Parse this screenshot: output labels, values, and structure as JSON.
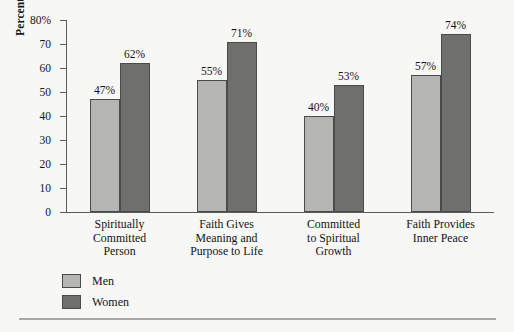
{
  "chart_data": {
    "type": "bar",
    "title": "",
    "xlabel": "",
    "ylabel": "Percent Agreeing",
    "ylim": [
      0,
      80
    ],
    "y_ticks": [
      0,
      10,
      20,
      30,
      40,
      50,
      60,
      70,
      80
    ],
    "y_tick_labels": [
      "0",
      "10",
      "20",
      "30",
      "40",
      "50",
      "60",
      "70",
      "80%"
    ],
    "grid": false,
    "legend_position": "bottom-left",
    "categories": [
      "Spiritually\nCommitted\nPerson",
      "Faith Gives\nMeaning and\nPurpose to Life",
      "Committed\nto Spiritual\nGrowth",
      "Faith Provides\nInner Peace"
    ],
    "category_lines": [
      [
        "Spiritually",
        "Committed",
        "Person"
      ],
      [
        "Faith Gives",
        "Meaning and",
        "Purpose to Life"
      ],
      [
        "Committed",
        "to Spiritual",
        "Growth"
      ],
      [
        "Faith Provides",
        "Inner Peace"
      ]
    ],
    "series": [
      {
        "name": "Men",
        "color": "#b5b5b3",
        "values": [
          47,
          55,
          40,
          57
        ],
        "value_labels": [
          "47%",
          "55%",
          "40%",
          "57%"
        ]
      },
      {
        "name": "Women",
        "color": "#6f6f6d",
        "values": [
          62,
          71,
          53,
          74
        ],
        "value_labels": [
          "62%",
          "71%",
          "53%",
          "74%"
        ]
      }
    ]
  },
  "legend": {
    "items": [
      {
        "label": "Men",
        "color": "#b5b5b3"
      },
      {
        "label": "Women",
        "color": "#6f6f6d"
      }
    ]
  },
  "colors": {
    "background": "#f7f7f5",
    "axis": "#5a5a5a",
    "bar_border": "#4a4a4a",
    "men": "#b5b5b3",
    "women": "#6f6f6d",
    "rule": "#a8a8a8",
    "text": "#141414"
  }
}
